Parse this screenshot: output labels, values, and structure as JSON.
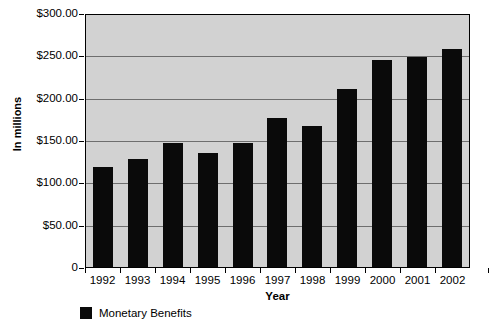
{
  "chart_data": {
    "type": "bar",
    "title": "",
    "xlabel": "Year",
    "ylabel": "In millions",
    "categories": [
      "1992",
      "1993",
      "1994",
      "1995",
      "1996",
      "1997",
      "1998",
      "1999",
      "2000",
      "2001",
      "2002"
    ],
    "values": [
      118,
      127,
      147,
      135,
      146,
      176,
      167,
      210,
      244,
      248,
      258
    ],
    "series": [
      {
        "name": "Monetary Benefits",
        "values": [
          118,
          127,
          147,
          135,
          146,
          176,
          167,
          210,
          244,
          248,
          258
        ],
        "color": "#0a0a0a"
      }
    ],
    "ylim": [
      0,
      300
    ],
    "ytick_values": [
      300,
      250,
      200,
      150,
      100,
      50,
      0
    ],
    "ytick_labels": [
      "$300.00",
      "$250.00",
      "$200.00",
      "$150.00",
      "$100.00",
      "$50.00",
      "0"
    ],
    "grid": true,
    "legend_position": "bottom-left",
    "plot_background": "#d2d2d2",
    "gridline_color": "#6e6e6e",
    "axis_color": "#000000"
  },
  "legend": {
    "entries": [
      {
        "label": "Monetary Benefits",
        "color": "#0a0a0a"
      }
    ]
  }
}
